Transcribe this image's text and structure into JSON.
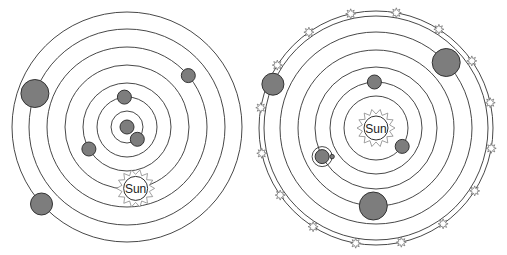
{
  "diagrams": [
    {
      "id": "geocentric",
      "title": "",
      "center_body": "earth",
      "sun_label": "Sun",
      "orbit_count": 7,
      "bodies": [
        {
          "name": "moon",
          "orbit": 1,
          "angle_deg": 50,
          "size": "small"
        },
        {
          "name": "mercury",
          "orbit": 2,
          "angle_deg": -95,
          "size": "small"
        },
        {
          "name": "venus",
          "orbit": 3,
          "angle_deg": 150,
          "size": "small"
        },
        {
          "name": "sun",
          "orbit": 4,
          "angle_deg": 82,
          "size": "sun"
        },
        {
          "name": "mars",
          "orbit": 5,
          "angle_deg": -40,
          "size": "small"
        },
        {
          "name": "jupiter",
          "orbit": 6,
          "angle_deg": -160,
          "size": "large"
        },
        {
          "name": "saturn",
          "orbit": 7,
          "angle_deg": 138,
          "size": "medium"
        }
      ]
    },
    {
      "id": "heliocentric",
      "title": "",
      "center_body": "sun",
      "sun_label": "Sun",
      "orbit_count": 7,
      "bodies": [
        {
          "name": "mercury",
          "orbit": 1,
          "angle_deg": 35,
          "size": "small"
        },
        {
          "name": "venus",
          "orbit": 2,
          "angle_deg": -92,
          "size": "small"
        },
        {
          "name": "earth",
          "orbit": 3,
          "angle_deg": 152,
          "size": "small",
          "has_moon": true
        },
        {
          "name": "mars",
          "orbit": 4,
          "angle_deg": 92,
          "size": "large"
        },
        {
          "name": "jupiter",
          "orbit": 5,
          "angle_deg": -43,
          "size": "large"
        },
        {
          "name": "saturn",
          "orbit": 6,
          "angle_deg": -157,
          "size": "medium"
        }
      ],
      "fixed_stars": 16
    }
  ]
}
